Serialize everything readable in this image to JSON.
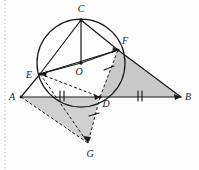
{
  "figure": {
    "canvas": {
      "width": 199,
      "height": 170
    },
    "colors": {
      "stroke": "#1a1a1a",
      "shade_fill": "#c9c9c9",
      "shade_fill_alt": "#d2d2d2",
      "background": "#fdfdfd",
      "margin_rule": "#b9b9b9"
    }
  },
  "points": [
    {
      "name": "A",
      "label": "A",
      "x": 21,
      "y": 97,
      "label_x": 12,
      "label_y": 100
    },
    {
      "name": "B",
      "label": "B",
      "x": 181,
      "y": 97,
      "label_x": 186,
      "label_y": 100
    },
    {
      "name": "C",
      "label": "C",
      "x": 81,
      "y": 20,
      "label_x": 78,
      "label_y": 12
    },
    {
      "name": "D",
      "label": "D",
      "x": 100,
      "y": 97,
      "label_x": 103,
      "label_y": 106
    },
    {
      "name": "E",
      "label": "E",
      "x": 40,
      "y": 74,
      "label_x": 28,
      "label_y": 78
    },
    {
      "name": "F",
      "label": "F",
      "x": 118,
      "y": 50,
      "label_x": 123,
      "label_y": 45
    },
    {
      "name": "G",
      "label": "G",
      "x": 88,
      "y": 143,
      "label_x": 86,
      "label_y": 156
    },
    {
      "name": "O",
      "label": "O",
      "x": 81,
      "y": 63,
      "label_x": 76,
      "label_y": 75
    }
  ],
  "circle": {
    "name": "circumcircle",
    "cx": 81,
    "cy": 63,
    "r": 44
  },
  "solid_segments": [
    {
      "name": "AB",
      "from": "A",
      "to": "B"
    },
    {
      "name": "AE",
      "from": "A",
      "to": "E"
    },
    {
      "name": "CO",
      "from": "C",
      "to": "O"
    },
    {
      "name": "CE",
      "from": "C",
      "to": "E"
    },
    {
      "name": "CF",
      "from": "C",
      "to": "F"
    },
    {
      "name": "EO",
      "from": "E",
      "to": "O"
    },
    {
      "name": "OF",
      "from": "O",
      "to": "F"
    },
    {
      "name": "EF",
      "from": "E",
      "to": "F"
    },
    {
      "name": "FB",
      "from": "F",
      "to": "B"
    },
    {
      "name": "FD",
      "from": "F",
      "to": "D"
    }
  ],
  "dashed_segments": [
    {
      "name": "ED",
      "from": "E",
      "to": "D"
    },
    {
      "name": "EG",
      "from": "E",
      "to": "G"
    },
    {
      "name": "AG",
      "from": "A",
      "to": "G"
    },
    {
      "name": "DG",
      "from": "D",
      "to": "G"
    },
    {
      "name": "DF-dashed",
      "from": "D",
      "to": "F"
    }
  ],
  "shaded_regions": [
    {
      "name": "triangle-DFB",
      "vertices": "D,F,B"
    },
    {
      "name": "triangle-ADG",
      "vertices": "A,D,G"
    }
  ],
  "tick_marks": [
    {
      "name": "tick-AD",
      "segment": "AD",
      "count": 2
    },
    {
      "name": "tick-DB",
      "segment": "DB",
      "count": 2
    },
    {
      "name": "tick-DF",
      "segment": "DF",
      "count": 1
    },
    {
      "name": "tick-DG",
      "segment": "DG",
      "count": 1
    }
  ],
  "arrowheads": [
    {
      "name": "arrow-to-E",
      "at": "E"
    },
    {
      "name": "arrow-to-F",
      "at": "F"
    },
    {
      "name": "arrow-to-G",
      "at": "G"
    },
    {
      "name": "arrow-to-D",
      "at": "D"
    },
    {
      "name": "arrow-to-O",
      "at": "O"
    },
    {
      "name": "arrow-to-B",
      "at": "B"
    }
  ]
}
